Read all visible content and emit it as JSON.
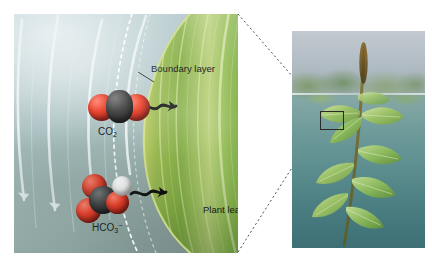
{
  "figure": {
    "type": "scientific-illustration",
    "panels": [
      "cross-section-diagram",
      "whole-plant-photograph"
    ]
  },
  "diagram": {
    "labels": {
      "boundary_layer": "Boundary layer",
      "co2": "CO",
      "co2_sub": "2",
      "hco3": "HCO",
      "hco3_sub": "3",
      "hco3_sup": "−",
      "plant_leaf": "Plant leaf"
    },
    "molecules": [
      {
        "name": "carbon-dioxide",
        "formula": "CO2",
        "atoms": [
          "oxygen",
          "carbon",
          "oxygen"
        ],
        "atom_colors": [
          "#d62b14",
          "#1d1d1d",
          "#d62b14"
        ]
      },
      {
        "name": "bicarbonate",
        "formula": "HCO3-",
        "atoms": [
          "oxygen",
          "oxygen",
          "carbon",
          "oxygen",
          "hydrogen"
        ],
        "atom_colors": [
          "#d62b14",
          "#d62b14",
          "#1d1d1d",
          "#d62b14",
          "#f2f2f2"
        ]
      }
    ],
    "flow": {
      "name": "water-current-streamlines",
      "count": 4,
      "color": "#eef4f5",
      "direction": "downward"
    },
    "diffusion_arrows": {
      "count": 2,
      "style": "wavy",
      "color": "#0d0d0d",
      "direction": "toward-leaf"
    },
    "boundary_layer_line": {
      "style": "dashed",
      "color": "#ffffff"
    },
    "leaf": {
      "name": "enlarged-leaf",
      "colors": [
        "#9fbf57",
        "#7fae49",
        "#5f9238",
        "#cfe08a"
      ]
    }
  },
  "photo": {
    "name": "pondweed-photograph",
    "scene": "submerged aquatic plant with flower spike above the water surface",
    "elements": [
      "water-surface",
      "flower-spike",
      "stem",
      "submerged-leaves",
      "magnification-callout-box"
    ],
    "water_color": "#5c8d8e",
    "sky_color": "#b4bec6"
  },
  "connector": {
    "name": "magnification-leader",
    "style": "dotted",
    "color": "#3a3a3a"
  }
}
